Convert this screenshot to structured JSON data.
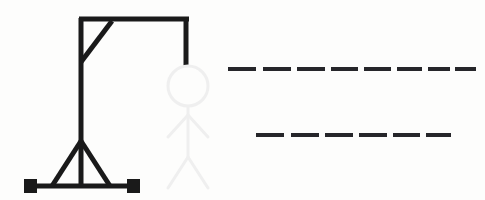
{
  "scene": {
    "title": "Hangman Game Drawing",
    "background_color": "#fdfdfc",
    "width": 485,
    "height": 200
  },
  "gallows": {
    "color": "#1a1a1a",
    "stroke_width": 5,
    "label": "gallows",
    "parts": {
      "base_bar": {
        "x1": 30,
        "y1": 186,
        "x2": 134,
        "y2": 186
      },
      "left_foot": {
        "x": 24,
        "y": 179,
        "w": 13,
        "h": 14
      },
      "right_foot": {
        "x": 127,
        "y": 179,
        "w": 13,
        "h": 14
      },
      "vertical_post": {
        "x1": 81,
        "y1": 186,
        "x2": 81,
        "y2": 18
      },
      "brace_left": {
        "x1": 52,
        "y1": 186,
        "x2": 81,
        "y2": 141
      },
      "brace_right": {
        "x1": 110,
        "y1": 186,
        "x2": 81,
        "y2": 141
      },
      "top_beam": {
        "x1": 79,
        "y1": 19,
        "x2": 189,
        "y2": 19
      },
      "corner_brace": {
        "x1": 81,
        "y1": 62,
        "x2": 112,
        "y2": 21
      },
      "rope": {
        "x1": 186,
        "y1": 21,
        "x2": 186,
        "y2": 66
      }
    }
  },
  "figure": {
    "color": "#efefef",
    "stroke_width": 3,
    "label": "hanged-stick-figure",
    "state": "faint",
    "parts": {
      "head": {
        "cx": 188,
        "cy": 86,
        "r": 20
      },
      "torso": {
        "x1": 188,
        "y1": 106,
        "x2": 188,
        "y2": 157
      },
      "arm_left": {
        "x1": 188,
        "y1": 115,
        "x2": 168,
        "y2": 137
      },
      "arm_right": {
        "x1": 188,
        "y1": 115,
        "x2": 208,
        "y2": 137
      },
      "leg_left": {
        "x1": 188,
        "y1": 157,
        "x2": 168,
        "y2": 188
      },
      "leg_right": {
        "x1": 188,
        "y1": 157,
        "x2": 208,
        "y2": 188
      }
    }
  },
  "word_blanks": {
    "color": "#26262a",
    "dash_height": 4,
    "label": "word-blanks",
    "rows": [
      {
        "name": "row-1",
        "letter_count": 8,
        "y": 67,
        "dashes": [
          {
            "x": 228,
            "w": 28
          },
          {
            "x": 263,
            "w": 28
          },
          {
            "x": 297,
            "w": 28
          },
          {
            "x": 331,
            "w": 27
          },
          {
            "x": 364,
            "w": 27
          },
          {
            "x": 397,
            "w": 25
          },
          {
            "x": 428,
            "w": 22
          },
          {
            "x": 455,
            "w": 21
          }
        ]
      },
      {
        "name": "row-2",
        "letter_count": 6,
        "y": 133,
        "dashes": [
          {
            "x": 256,
            "w": 28
          },
          {
            "x": 291,
            "w": 28
          },
          {
            "x": 325,
            "w": 28
          },
          {
            "x": 359,
            "w": 28
          },
          {
            "x": 393,
            "w": 27
          },
          {
            "x": 426,
            "w": 25
          }
        ]
      }
    ]
  }
}
